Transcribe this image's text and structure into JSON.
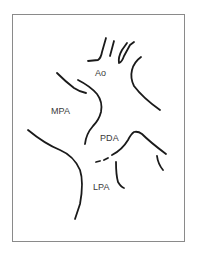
{
  "diagram": {
    "type": "anatomical line drawing",
    "labels": {
      "ao": "Ao",
      "mpa": "MPA",
      "pda": "PDA",
      "lpa": "LPA"
    },
    "colors": {
      "stroke": "#1a1a1a",
      "frame": "#8a8a8a",
      "label": "#3a3a3a",
      "background": "#ffffff"
    }
  }
}
